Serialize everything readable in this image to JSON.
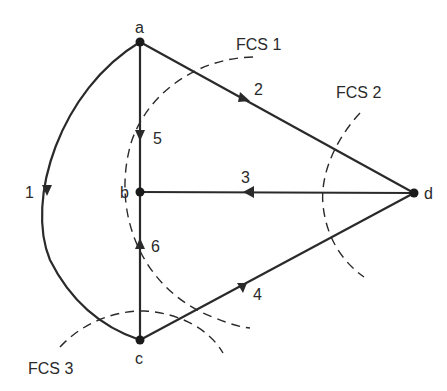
{
  "diagram": {
    "type": "directed-graph",
    "nodes": [
      {
        "id": "a",
        "label": "a"
      },
      {
        "id": "b",
        "label": "b"
      },
      {
        "id": "c",
        "label": "c"
      },
      {
        "id": "d",
        "label": "d"
      }
    ],
    "edges": [
      {
        "id": "1",
        "label": "1",
        "from": "a",
        "to": "c",
        "style": "curved"
      },
      {
        "id": "2",
        "label": "2",
        "from": "a",
        "to": "d"
      },
      {
        "id": "3",
        "label": "3",
        "from": "d",
        "to": "b"
      },
      {
        "id": "4",
        "label": "4",
        "from": "c",
        "to": "d"
      },
      {
        "id": "5",
        "label": "5",
        "from": "a",
        "to": "b"
      },
      {
        "id": "6",
        "label": "6",
        "from": "c",
        "to": "b"
      }
    ],
    "cutsets": [
      {
        "id": "fcs1",
        "label": "FCS 1"
      },
      {
        "id": "fcs2",
        "label": "FCS 2"
      },
      {
        "id": "fcs3",
        "label": "FCS 3"
      }
    ]
  }
}
